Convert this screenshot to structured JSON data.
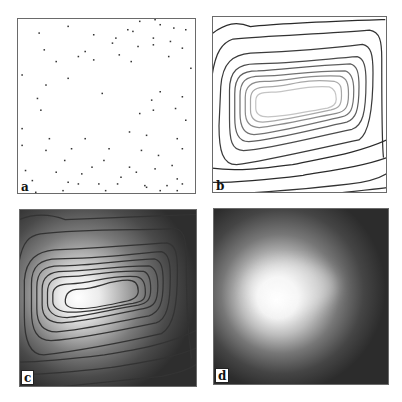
{
  "figure": {
    "panels": [
      {
        "id": "a",
        "label": "a",
        "kind": "scatter-sample-points"
      },
      {
        "id": "b",
        "label": "b",
        "kind": "contour-lines"
      },
      {
        "id": "c",
        "label": "c",
        "kind": "contour-over-grayscale"
      },
      {
        "id": "d",
        "label": "d",
        "kind": "grayscale-density"
      }
    ],
    "colors": {
      "background": "#ffffff",
      "frame": "#6a6a6a",
      "points": "#333333",
      "contour_dark": "#2a2a2a",
      "contour_light": "#cfcfcf",
      "field_low": "#2e2e2e",
      "field_high": "#ffffff"
    },
    "scatter_points": [
      [
        30,
        5
      ],
      [
        13,
        9
      ],
      [
        65,
        7
      ],
      [
        72,
        2
      ],
      [
        81,
        1
      ],
      [
        92,
        6
      ],
      [
        99,
        7
      ],
      [
        45,
        10
      ],
      [
        84,
        4
      ],
      [
        68,
        8
      ],
      [
        58,
        12
      ],
      [
        80,
        12
      ],
      [
        90,
        14
      ],
      [
        56,
        15
      ],
      [
        97,
        18
      ],
      [
        16,
        19
      ],
      [
        23,
        26
      ],
      [
        71,
        17
      ],
      [
        80,
        16
      ],
      [
        36,
        23
      ],
      [
        45,
        25
      ],
      [
        40,
        20
      ],
      [
        60,
        22
      ],
      [
        67,
        26
      ],
      [
        89,
        23
      ],
      [
        102,
        30
      ],
      [
        3,
        34
      ],
      [
        30,
        36
      ],
      [
        17,
        40
      ],
      [
        50,
        45
      ],
      [
        84,
        44
      ],
      [
        79,
        49
      ],
      [
        97,
        47
      ],
      [
        93,
        54
      ],
      [
        80,
        55
      ],
      [
        12,
        48
      ],
      [
        14,
        55
      ],
      [
        72,
        57
      ],
      [
        99,
        61
      ],
      [
        3,
        66
      ],
      [
        19,
        72
      ],
      [
        40,
        72
      ],
      [
        66,
        68
      ],
      [
        76,
        70
      ],
      [
        94,
        72
      ],
      [
        3,
        76
      ],
      [
        97,
        78
      ],
      [
        17,
        79
      ],
      [
        32,
        78
      ],
      [
        54,
        78
      ],
      [
        73,
        79
      ],
      [
        83,
        82
      ],
      [
        28,
        85
      ],
      [
        51,
        85
      ],
      [
        44,
        89
      ],
      [
        66,
        89
      ],
      [
        91,
        88
      ],
      [
        5,
        91
      ],
      [
        23,
        92
      ],
      [
        38,
        93
      ],
      [
        70,
        92
      ],
      [
        61,
        95
      ],
      [
        81,
        90
      ],
      [
        94,
        96
      ],
      [
        97,
        99
      ],
      [
        9,
        97
      ],
      [
        30,
        98
      ],
      [
        59,
        99
      ],
      [
        36,
        99
      ],
      [
        48,
        99
      ],
      [
        88,
        100
      ],
      [
        76,
        101
      ],
      [
        84,
        103
      ],
      [
        94,
        103
      ],
      [
        52,
        103
      ],
      [
        11,
        104
      ],
      [
        27,
        103
      ],
      [
        75,
        100
      ]
    ]
  }
}
